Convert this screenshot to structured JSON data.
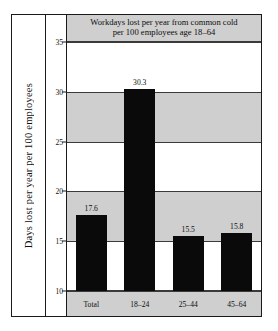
{
  "chart_data": {
    "type": "bar",
    "title": "Workdays lost per year from common cold per 100 employees age 18–64",
    "title_lines": [
      "Workdays lost per year from common cold",
      "per 100 employees age 18–64"
    ],
    "xlabel": "",
    "ylabel": "Days lost per year per 100 employees",
    "categories": [
      "Total",
      "18–24",
      "25–44",
      "45–64"
    ],
    "values": [
      17.6,
      30.3,
      15.5,
      15.8
    ],
    "value_labels": [
      "17.6",
      "30.3",
      "15.5",
      "15.8"
    ],
    "ylim": [
      10,
      35
    ],
    "yticks": [
      35,
      30,
      25,
      20,
      15,
      10
    ],
    "ytick_labels": [
      "35",
      "30",
      "25",
      "20",
      "15",
      "10"
    ],
    "grid": true,
    "legend": "none",
    "bands": [
      {
        "from": 30,
        "to": 25,
        "color": "#cfcfcf"
      },
      {
        "from": 20,
        "to": 15,
        "color": "#cfcfcf"
      }
    ],
    "colors": {
      "bar": "#0a0a0a",
      "band": "#cfcfcf",
      "plot_background": "#ffffff",
      "frame": "#1a1a1a",
      "gridline": "#3a3a3a",
      "title_band": "#cfcfcf",
      "category_band": "#cfcfcf"
    }
  }
}
